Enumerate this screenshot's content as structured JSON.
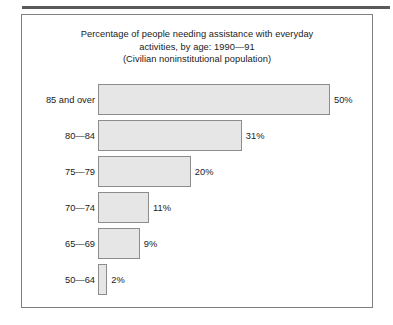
{
  "chart_data": {
    "type": "bar",
    "orientation": "horizontal",
    "title_lines": [
      "Percentage of people needing assistance with everyday",
      "activities, by age: 1990—91",
      "(Civilian noninstitutional population)"
    ],
    "categories": [
      "85 and over",
      "80—84",
      "75—79",
      "70—74",
      "65—69",
      "50—64"
    ],
    "values": [
      50,
      31,
      20,
      11,
      9,
      2
    ],
    "value_labels": [
      "50%",
      "31%",
      "20%",
      "11%",
      "9%",
      "2%"
    ],
    "xlabel": "",
    "ylabel": "",
    "xlim": [
      0,
      50
    ],
    "grid": false,
    "legend": "none",
    "bar_fill_color": "#e6e6e6",
    "bar_border_color": "#8c8c8c",
    "frame_color": "#808080",
    "rule_color": "#5a5a5a",
    "background_color": "#ffffff",
    "text_color": "#1a1a1a"
  }
}
